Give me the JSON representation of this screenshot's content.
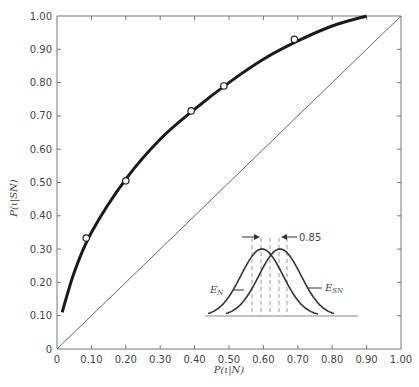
{
  "chart_data": {
    "type": "line",
    "title": "",
    "xlabel": "P(ι|N)",
    "ylabel": "P(ι|SN)",
    "xlim": [
      0,
      1.0
    ],
    "ylim": [
      0,
      1.0
    ],
    "grid": false,
    "x_ticks": [
      "0",
      "0.10",
      "0.20",
      "0.30",
      "0.40",
      "0.50",
      "0.60",
      "0.70",
      "0.80",
      "0.90",
      "1.00"
    ],
    "y_ticks": [
      "0",
      "0.10",
      "0.20",
      "0.30",
      "0.40",
      "0.50",
      "0.60",
      "0.70",
      "0.80",
      "0.90",
      "1.00"
    ],
    "series": [
      {
        "name": "observed points",
        "style": "open-circles",
        "x": [
          0.085,
          0.2,
          0.39,
          0.485,
          0.69
        ],
        "y": [
          0.333,
          0.505,
          0.715,
          0.79,
          0.93
        ]
      },
      {
        "name": "fitted ROC curve",
        "style": "thick-line",
        "x": [
          0.015,
          0.05,
          0.1,
          0.2,
          0.3,
          0.4,
          0.5,
          0.6,
          0.7,
          0.8,
          0.9
        ],
        "y": [
          0.11,
          0.23,
          0.35,
          0.51,
          0.63,
          0.72,
          0.8,
          0.87,
          0.925,
          0.97,
          1.0
        ]
      },
      {
        "name": "chance diagonal",
        "style": "thin-line",
        "x": [
          0,
          1.0
        ],
        "y": [
          0,
          1.0
        ]
      }
    ],
    "inset": {
      "description": "Two overlapping normal distributions with dashed criterion lines",
      "labels": {
        "noise": "E",
        "noise_sub": "N",
        "signal": "E",
        "signal_sub": "SN"
      },
      "annotation": "0.85",
      "criteria_count": 5
    }
  }
}
